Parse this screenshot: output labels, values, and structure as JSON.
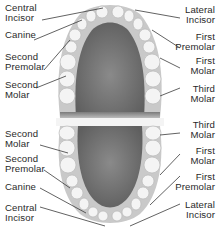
{
  "colors": {
    "tooth": "#f4f4f4",
    "tooth_outline": "#b9b9b9",
    "gum": "#c9c9c9",
    "palate": "#6e6e6e",
    "leader_line": "#3a3a3a",
    "label_text": "#2a2a2a"
  },
  "upper_arch": {
    "left_labels": [
      {
        "id": "central-incisor",
        "text": "Central\nIncisor"
      },
      {
        "id": "canine",
        "text": "Canine"
      },
      {
        "id": "second-premolar",
        "text": "Second\nPremolar"
      },
      {
        "id": "second-molar",
        "text": "Second\nMolar"
      }
    ],
    "right_labels": [
      {
        "id": "lateral-incisor",
        "text": "Lateral\nIncisor"
      },
      {
        "id": "first-premolar",
        "text": "First\nPremolar"
      },
      {
        "id": "first-molar",
        "text": "First\nMolar"
      },
      {
        "id": "third-molar",
        "text": "Third\nMolar"
      }
    ]
  },
  "lower_arch": {
    "left_labels": [
      {
        "id": "second-molar",
        "text": "Second\nMolar"
      },
      {
        "id": "second-premolar",
        "text": "Second\nPremolar"
      },
      {
        "id": "canine",
        "text": "Canine"
      },
      {
        "id": "central-incisor",
        "text": "Central\nIncisor"
      }
    ],
    "right_labels": [
      {
        "id": "third-molar",
        "text": "Third\nMolar"
      },
      {
        "id": "first-molar",
        "text": "First\nMolar"
      },
      {
        "id": "first-premolar",
        "text": "First\nPremolar"
      },
      {
        "id": "lateral-incisor",
        "text": "Lateral\nIncisor"
      }
    ]
  }
}
